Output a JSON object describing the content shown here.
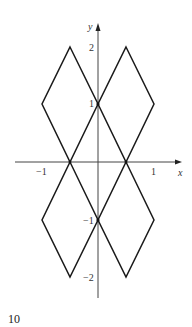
{
  "figure": {
    "number": "10",
    "axes": {
      "x_label": "x",
      "y_label": "y",
      "x_ticks": [
        {
          "value": -1,
          "label": "−1"
        },
        {
          "value": 1,
          "label": "1"
        }
      ],
      "y_ticks": [
        {
          "value": 2,
          "label": "2"
        },
        {
          "value": 1,
          "label": "1"
        },
        {
          "value": -1,
          "label": "−1"
        },
        {
          "value": -2,
          "label": "−2"
        }
      ]
    },
    "shapes": [
      {
        "name": "upper-left-diamond",
        "vertices": [
          [
            -0.5,
            2
          ],
          [
            0,
            1
          ],
          [
            -0.5,
            0
          ],
          [
            -1,
            1
          ]
        ]
      },
      {
        "name": "upper-right-diamond",
        "vertices": [
          [
            0.5,
            2
          ],
          [
            1,
            1
          ],
          [
            0.5,
            0
          ],
          [
            0,
            1
          ]
        ]
      },
      {
        "name": "lower-left-diamond",
        "vertices": [
          [
            -0.5,
            0
          ],
          [
            0,
            -1
          ],
          [
            -0.5,
            -2
          ],
          [
            -1,
            -1
          ]
        ]
      },
      {
        "name": "lower-right-diamond",
        "vertices": [
          [
            0.5,
            0
          ],
          [
            1,
            -1
          ],
          [
            0.5,
            -2
          ],
          [
            0,
            -1
          ]
        ]
      }
    ],
    "colors": {
      "stroke": "#1a1a1a",
      "axis": "#444444"
    }
  }
}
